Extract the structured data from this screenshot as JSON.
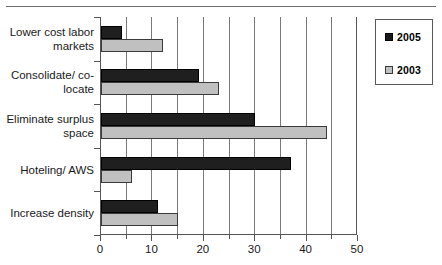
{
  "chart_data": {
    "type": "bar",
    "orientation": "horizontal",
    "title": "",
    "subtitle": "",
    "xlabel": "",
    "ylabel": "",
    "xlim": [
      0,
      50
    ],
    "xticks": [
      0,
      10,
      20,
      30,
      40,
      50
    ],
    "xtick_labels": [
      "0",
      "10",
      "20",
      "30",
      "40",
      "50"
    ],
    "xminor_ticks": [
      5,
      15,
      25,
      35,
      45
    ],
    "grid": "vertical-major-and-minor",
    "gridlines_at": [
      5,
      10,
      15,
      20,
      25,
      30,
      35,
      40,
      45
    ],
    "categories": [
      "Lower cost labor markets",
      "Consolidate/ co-locate",
      "Eliminate surplus space",
      "Hoteling/ AWS",
      "Increase density"
    ],
    "series": [
      {
        "name": "2005",
        "color": "#1f1f1f",
        "values": [
          4,
          19,
          30,
          37,
          11
        ]
      },
      {
        "name": "2003",
        "color": "#c0c0c0",
        "values": [
          12,
          23,
          44,
          6,
          15
        ]
      }
    ],
    "legend": {
      "position": "right",
      "entries": [
        {
          "label": "2005",
          "swatch": "dark-filled-square"
        },
        {
          "label": "2003",
          "swatch": "light-gray-square"
        }
      ]
    },
    "annotations": []
  },
  "colors": {
    "series_2005": "#1f1f1f",
    "series_2003": "#c0c0c0",
    "gridline": "#7a7a7a",
    "axis": "#555555",
    "text": "#1a1a1a",
    "background": "#ffffff"
  }
}
